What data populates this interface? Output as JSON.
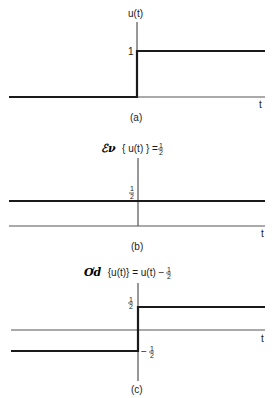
{
  "panels": [
    {
      "id": "a",
      "caption": "(a)",
      "y_label": "u(t)",
      "x_label": "t",
      "level_label": "1",
      "description": "Unit step: 0 for t<0, 1 for t>0"
    },
    {
      "id": "b",
      "caption": "(b)",
      "title_prefix": "ℰν",
      "title_body": "{ u(t) } = ",
      "title_value": "1/2",
      "x_label": "t",
      "level_label_num": "1",
      "level_label_den": "2",
      "description": "Even part of u(t) is constant 1/2"
    },
    {
      "id": "c",
      "caption": "(c)",
      "title_prefix": "Ơd",
      "title_body": "{u(t)} = u(t) − ",
      "title_value": "1/2",
      "x_label": "t",
      "upper_label_num": "1",
      "upper_label_den": "2",
      "lower_label_sign": "−",
      "lower_label_num": "1",
      "lower_label_den": "2",
      "description": "Odd part of u(t): -1/2 for t<0, 1/2 for t>0"
    }
  ],
  "colors": {
    "line": "#1a1a1a",
    "axis": "#333333",
    "background": "#ffffff"
  }
}
